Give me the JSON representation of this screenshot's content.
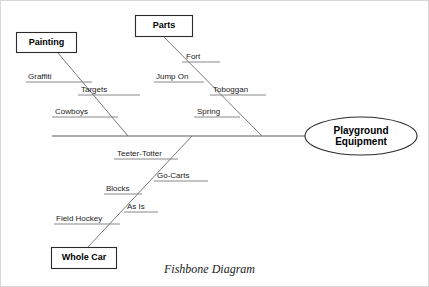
{
  "diagram": {
    "type": "fishbone",
    "caption": "Fishbone Diagram",
    "head": {
      "line1": "Playground",
      "line2": "Equipment"
    },
    "categories": [
      {
        "name": "Painting",
        "position": "upper-left",
        "causes": [
          "Graffiti",
          "Targets",
          "Cowboys"
        ]
      },
      {
        "name": "Parts",
        "position": "upper-right",
        "causes": [
          "Fort",
          "Jump On",
          "Toboggan",
          "Spring"
        ]
      },
      {
        "name": "Whole Car",
        "position": "lower",
        "causes": [
          "Teeter-Totter",
          "Go-Carts",
          "Blocks",
          "As Is",
          "Field Hockey"
        ]
      }
    ]
  },
  "labels": {
    "painting": "Painting",
    "parts": "Parts",
    "whole_car": "Whole Car",
    "graffiti": "Graffiti",
    "targets": "Targets",
    "cowboys": "Cowboys",
    "fort": "Fort",
    "jump_on": "Jump On",
    "toboggan": "Toboggan",
    "spring": "Spring",
    "teeter_totter": "Teeter-Totter",
    "go_carts": "Go-Carts",
    "blocks": "Blocks",
    "as_is": "As Is",
    "field_hockey": "Field Hockey",
    "head_line1": "Playground",
    "head_line2": "Equipment",
    "caption": "Fishbone Diagram"
  },
  "colors": {
    "background": "#ffffff",
    "line": "#6a6a6a",
    "spine": "#5a5a5a",
    "box_stroke": "#2b2b2b",
    "text": "#000000",
    "frame": "#d8d8d8"
  }
}
